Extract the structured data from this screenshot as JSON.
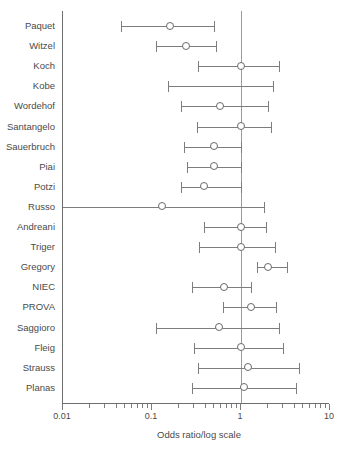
{
  "chart_data": {
    "type": "scatter",
    "subtype": "forest-plot",
    "title": "",
    "xlabel": "Odds ratio/log scale",
    "ylabel": "",
    "xscale": "log",
    "xlim": [
      0.01,
      10
    ],
    "grid": false,
    "legend": null,
    "reference_line": 1,
    "xticks": [
      0.01,
      0.1,
      1,
      10
    ],
    "xticklabels": [
      "0.01",
      "0.1",
      "1",
      "10"
    ],
    "categories": [
      "Paquet",
      "Witzel",
      "Koch",
      "Kobe",
      "Wordehof",
      "Santangelo",
      "Sauerbruch",
      "Piai",
      "Potzi",
      "Russo",
      "Andreani",
      "Triger",
      "Gregory",
      "NIEC",
      "PROVA",
      "Saggioro",
      "Fleig",
      "Strauss",
      "Planas"
    ],
    "points": [
      {
        "study": "Paquet",
        "or": 0.16,
        "ci_low": 0.045,
        "ci_high": 0.5,
        "marker": true,
        "left_truncated": false
      },
      {
        "study": "Witzel",
        "or": 0.24,
        "ci_low": 0.11,
        "ci_high": 0.52,
        "marker": true,
        "left_truncated": false
      },
      {
        "study": "Koch",
        "or": 1.0,
        "ci_low": 0.33,
        "ci_high": 2.7,
        "marker": true,
        "left_truncated": false
      },
      {
        "study": "Kobe",
        "or": null,
        "ci_low": 0.15,
        "ci_high": 2.3,
        "marker": false,
        "left_truncated": false
      },
      {
        "study": "Wordehof",
        "or": 0.58,
        "ci_low": 0.21,
        "ci_high": 2.0,
        "marker": true,
        "left_truncated": false
      },
      {
        "study": "Santangelo",
        "or": 1.0,
        "ci_low": 0.32,
        "ci_high": 2.2,
        "marker": true,
        "left_truncated": false
      },
      {
        "study": "Sauerbruch",
        "or": 0.5,
        "ci_low": 0.23,
        "ci_high": 1.0,
        "marker": true,
        "left_truncated": false
      },
      {
        "study": "Piai",
        "or": 0.5,
        "ci_low": 0.25,
        "ci_high": 1.0,
        "marker": true,
        "left_truncated": false
      },
      {
        "study": "Potzi",
        "or": 0.38,
        "ci_low": 0.21,
        "ci_high": 1.0,
        "marker": true,
        "left_truncated": false
      },
      {
        "study": "Russo",
        "or": 0.13,
        "ci_low": 0.01,
        "ci_high": 1.8,
        "marker": true,
        "left_truncated": true
      },
      {
        "study": "Andreani",
        "or": 1.0,
        "ci_low": 0.38,
        "ci_high": 1.9,
        "marker": true,
        "left_truncated": false
      },
      {
        "study": "Triger",
        "or": 1.0,
        "ci_low": 0.34,
        "ci_high": 2.4,
        "marker": true,
        "left_truncated": false
      },
      {
        "study": "Gregory",
        "or": 2.0,
        "ci_low": 1.5,
        "ci_high": 3.3,
        "marker": true,
        "left_truncated": false
      },
      {
        "study": "NIEC",
        "or": 0.65,
        "ci_low": 0.28,
        "ci_high": 1.3,
        "marker": true,
        "left_truncated": false
      },
      {
        "study": "PROVA",
        "or": 1.3,
        "ci_low": 0.62,
        "ci_high": 2.5,
        "marker": true,
        "left_truncated": false
      },
      {
        "study": "Saggioro",
        "or": 0.57,
        "ci_low": 0.11,
        "ci_high": 2.7,
        "marker": true,
        "left_truncated": false
      },
      {
        "study": "Fleig",
        "or": 1.0,
        "ci_low": 0.3,
        "ci_high": 3.0,
        "marker": true,
        "left_truncated": false
      },
      {
        "study": "Strauss",
        "or": 1.2,
        "ci_low": 0.33,
        "ci_high": 4.5,
        "marker": true,
        "left_truncated": false
      },
      {
        "study": "Planas",
        "or": 1.08,
        "ci_low": 0.28,
        "ci_high": 4.2,
        "marker": true,
        "left_truncated": false
      }
    ],
    "colors": {
      "line": "#7d7d7d",
      "marker_edge": "#6a6a6a",
      "marker_fill": "#ffffff",
      "axis": "#6e6e6e",
      "reference_line": "#9a9a9a",
      "text": "#4a4a4a",
      "background": "#ffffff"
    }
  }
}
